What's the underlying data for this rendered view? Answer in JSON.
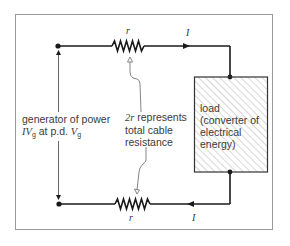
{
  "diagram": {
    "resistor_top_label": "r",
    "resistor_bottom_label": "r",
    "current_top_label": "I",
    "current_bottom_label": "I",
    "cable_label": {
      "line1": "2r represents",
      "line1_symbol": "2r",
      "line1_rest": " represents",
      "line2": "total cable",
      "line3": "resistance"
    },
    "generator_label": {
      "line1": "generator of power",
      "line2_sym1": "IV",
      "line2_sub1": "g",
      "line2_mid": " at p.d. ",
      "line2_sym2": "V",
      "line2_sub2": "g"
    },
    "load_label": {
      "line1": "load",
      "line2": "(converter of",
      "line3": "electrical",
      "line4": "energy)"
    },
    "colors": {
      "wire": "#1a1a1a",
      "frame": "#9a9a9a",
      "hatch": "#9a9a9a",
      "text": "#3a3a3a"
    }
  }
}
